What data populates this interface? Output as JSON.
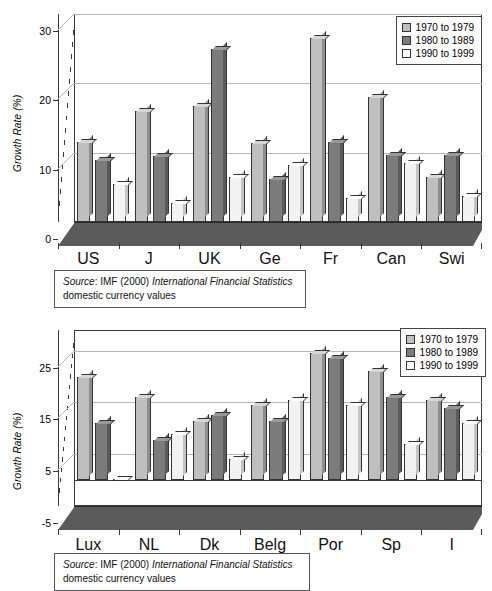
{
  "chart_data": [
    {
      "type": "bar",
      "title": "",
      "xlabel": "",
      "ylabel": "Growth Rate (%)",
      "ylim": [
        0,
        30
      ],
      "yticks": [
        0,
        10,
        20,
        30
      ],
      "grid": true,
      "legend_position": "top-right",
      "categories": [
        "US",
        "J",
        "UK",
        "Ge",
        "Fr",
        "Can",
        "Swi"
      ],
      "series": [
        {
          "name": "1970 to 1979",
          "color": "#bfbfbf",
          "values": [
            11.5,
            16.0,
            16.8,
            11.4,
            26.5,
            18.0,
            6.5
          ]
        },
        {
          "name": "1980 to 1989",
          "color": "#7b7b7b",
          "values": [
            9.0,
            9.5,
            25.0,
            6.2,
            11.5,
            9.7,
            9.7
          ]
        },
        {
          "name": "1990 to 1999",
          "color": "#ffffff",
          "values": [
            5.5,
            2.8,
            6.5,
            8.2,
            3.5,
            8.5,
            3.8
          ]
        }
      ],
      "source_prefix": "Source",
      "source_text": ": IMF (2000) ",
      "source_italic": "International Financial Statistics",
      "source_line2": "domestic currency values"
    },
    {
      "type": "bar",
      "title": "",
      "xlabel": "",
      "ylabel": "Growth Rate (%)",
      "ylim": [
        -5,
        29
      ],
      "yticks": [
        -5,
        5,
        15,
        25
      ],
      "grid": true,
      "legend_position": "top-right",
      "categories": [
        "Lux",
        "NL",
        "Dk",
        "Belg",
        "Por",
        "Sp",
        "I"
      ],
      "series": [
        {
          "name": "1970 to 1979",
          "color": "#bfbfbf",
          "values": [
            20.0,
            16.0,
            11.5,
            14.5,
            24.5,
            21.0,
            15.5
          ]
        },
        {
          "name": "1980 to 1989",
          "color": "#7b7b7b",
          "values": [
            11.0,
            7.8,
            12.5,
            11.5,
            23.5,
            16.0,
            14.0
          ]
        },
        {
          "name": "1990 to 1999",
          "color": "#ffffff",
          "values": [
            0.2,
            9.0,
            4.0,
            15.5,
            14.5,
            7.0,
            11.0
          ]
        }
      ],
      "source_prefix": "Source",
      "source_text": ": IMF (2000) ",
      "source_italic": "International Financial Statistics",
      "source_line2": "domestic currency values"
    }
  ]
}
